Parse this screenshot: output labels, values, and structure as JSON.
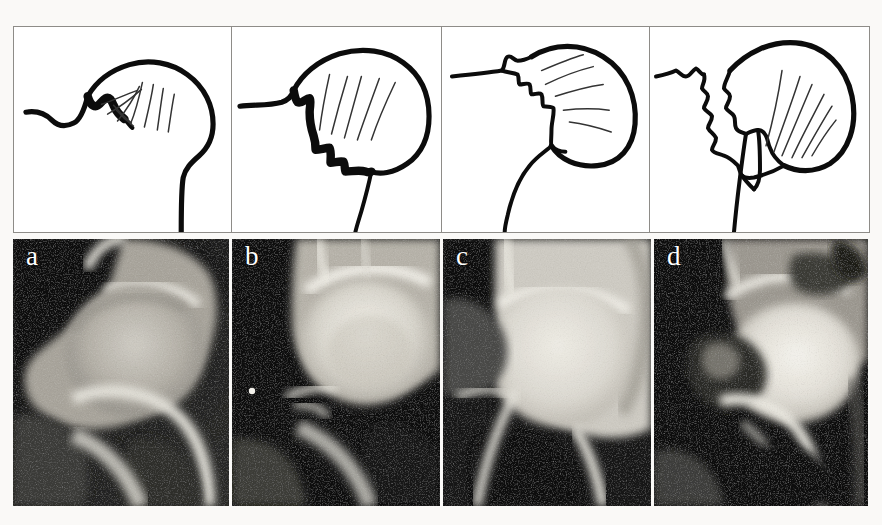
{
  "figure": {
    "kind": "medical-radiograph-figure",
    "background_color": "#faf9f7",
    "panel_border_color": "#8e8c88",
    "outline_color": "#0c0c0c",
    "label_color": "#ffffff",
    "panel_count": 4
  },
  "panels": [
    {
      "id": "a",
      "label": "a",
      "schematic_name": "schematic-hip-a",
      "radiograph_name": "radiograph-hip-a",
      "stage_note": "Minimal irregularity of the femoral head-neck junction",
      "width_px": 218
    },
    {
      "id": "b",
      "label": "b",
      "schematic_name": "schematic-hip-b",
      "radiograph_name": "radiograph-hip-b",
      "stage_note": "Moderate stepped irregularity along the inferior head-neck contour",
      "width_px": 210
    },
    {
      "id": "c",
      "label": "c",
      "schematic_name": "schematic-hip-c",
      "radiograph_name": "radiograph-hip-c",
      "stage_note": "Marked serrated deformity of the superior acetabular margin",
      "width_px": 208
    },
    {
      "id": "d",
      "label": "d",
      "schematic_name": "schematic-hip-d",
      "radiograph_name": "radiograph-hip-d",
      "stage_note": "Severe jagged destruction of both acetabular roof and head-neck junction",
      "width_px": 215
    }
  ]
}
